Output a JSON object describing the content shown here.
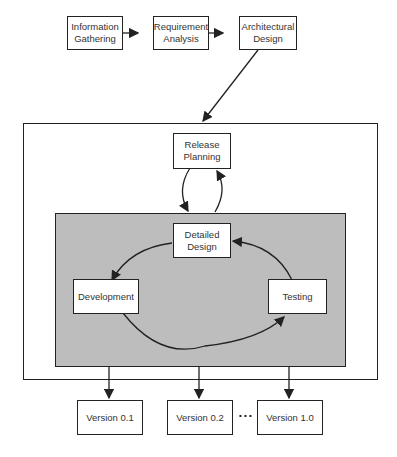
{
  "diagram": {
    "colors": {
      "shaded_region": "#bdbdbd",
      "stroke": "#222222",
      "box_fill": "#ffffff"
    },
    "top_row": [
      {
        "id": "info",
        "label": "Information\nGathering"
      },
      {
        "id": "req",
        "label": "Requirement\nAnalysis"
      },
      {
        "id": "arch",
        "label": "Architectural\nDesign"
      }
    ],
    "release_planning": "Release\nPlanning",
    "cycle": {
      "detailed_design": "Detailed\nDesign",
      "development": "Development",
      "testing": "Testing"
    },
    "versions": [
      "Version 0.1",
      "Version 0.2",
      "Version 1.0"
    ],
    "ellipsis": "• • •"
  }
}
